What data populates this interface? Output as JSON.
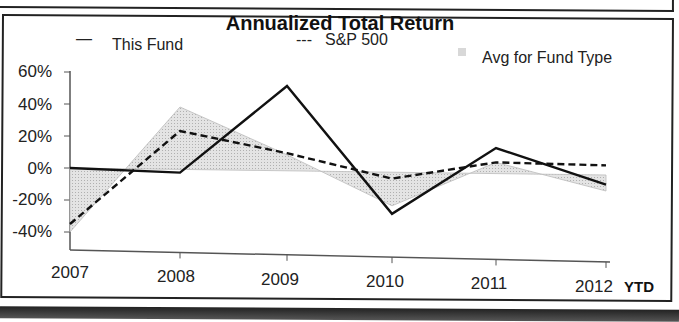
{
  "chart_data": {
    "type": "line",
    "title": "Annualized Total Return",
    "xlabel": "",
    "ylabel": "",
    "categories": [
      "2007",
      "2008",
      "2009",
      "2010",
      "2011",
      "2012"
    ],
    "x_suffix_label": "YTD",
    "ylim": [
      -40,
      60
    ],
    "yticks": [
      "60%",
      "40%",
      "20%",
      "0%",
      "-20%",
      "-40%"
    ],
    "ytick_values": [
      60,
      40,
      20,
      0,
      -20,
      -40
    ],
    "grid": false,
    "legend_position": "top",
    "series": [
      {
        "name": "This Fund",
        "style": "solid",
        "legend_marker": "—",
        "values": [
          0,
          -2,
          53,
          -26,
          16,
          -6
        ]
      },
      {
        "name": "S&P 500",
        "style": "dashed",
        "legend_marker": "---",
        "values": [
          -35,
          24,
          11,
          -4,
          7,
          6
        ]
      },
      {
        "name": "Avg for Fund Type",
        "style": "area",
        "legend_marker": "shaded",
        "values": [
          -40,
          39,
          10,
          -21,
          7,
          -10
        ]
      }
    ],
    "colors": {
      "this_fund": "#111111",
      "sp500": "#111111",
      "avg_fill": "#d8d8d8",
      "avg_edge": "#bbbbbb"
    }
  },
  "legend": {
    "this_fund_marker": "—",
    "this_fund": "This Fund",
    "sp500_marker": "---",
    "sp500": "S&P 500",
    "avg": "Avg for Fund Type"
  },
  "axis": {
    "x_labels": [
      "2007",
      "2008",
      "2009",
      "2010",
      "2011",
      "2012"
    ],
    "ytd": "YTD",
    "y_labels": [
      "60%",
      "40%",
      "20%",
      "0%",
      "-20%",
      "-40%"
    ]
  }
}
